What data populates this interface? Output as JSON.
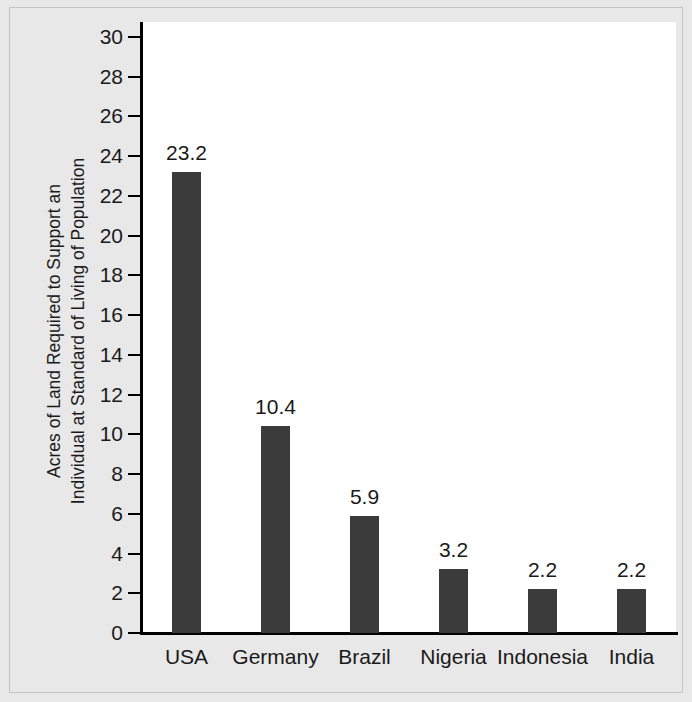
{
  "chart_data": {
    "type": "bar",
    "title": "",
    "subtitle": "",
    "xlabel": "",
    "ylabel_lines": [
      "Acres of Land Required to Support an",
      "Individual at Standard of Living of Population"
    ],
    "ylabel": "Acres of Land Required to Support an Individual at Standard of Living of Population",
    "categories": [
      "USA",
      "Germany",
      "Brazil",
      "Nigeria",
      "Indonesia",
      "India"
    ],
    "values": [
      23.2,
      10.4,
      5.9,
      3.2,
      2.2,
      2.2
    ],
    "value_labels": [
      "23.2",
      "10.4",
      "5.9",
      "3.2",
      "2.2",
      "2.2"
    ],
    "ylim": [
      0,
      30
    ],
    "yticks": [
      30,
      28,
      26,
      24,
      22,
      20,
      18,
      16,
      14,
      12,
      10,
      8,
      6,
      4,
      2,
      0
    ],
    "ytick_labels": [
      "30",
      "28",
      "26",
      "24",
      "22",
      "20",
      "18",
      "16",
      "14",
      "12",
      "10",
      "8",
      "6",
      "4",
      "2",
      "0"
    ],
    "grid": false,
    "legend": false,
    "legend_position": "none",
    "bar_color": "#3b3b3b",
    "plot_background": "#ffffff",
    "figure_background": "#e8e8e8",
    "axis_color": "#000000",
    "text_color": "#1a1a1a"
  }
}
